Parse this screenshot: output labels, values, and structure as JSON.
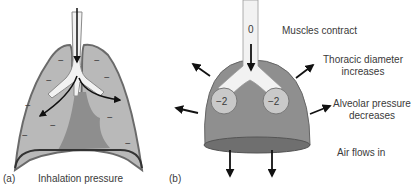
{
  "panel_a": {
    "label": "(a)",
    "caption": "Inhalation pressure",
    "pleural_signs": [
      "−",
      "−",
      "−",
      "−",
      "−",
      "−",
      "−",
      "−",
      "−"
    ]
  },
  "panel_b": {
    "label": "(b)",
    "airway_pressure": "0",
    "alveolus_left": "−2",
    "alveolus_right": "−2",
    "annotations": {
      "muscles": "Muscles contract",
      "thoracic_line1": "Thoracic diameter",
      "thoracic_line2": "increases",
      "alveolar_line1": "Alveolar pressure",
      "alveolar_line2": "decreases",
      "air": "Air flows in"
    }
  },
  "colors": {
    "lung_fill": "#b9b9b9",
    "lung_outline": "#6a6a6a",
    "heart_fill": "#8e8e8e",
    "dome_fill": "#8f8f8f",
    "airway_fill": "#f2f2f2",
    "arrow": "#111111"
  }
}
